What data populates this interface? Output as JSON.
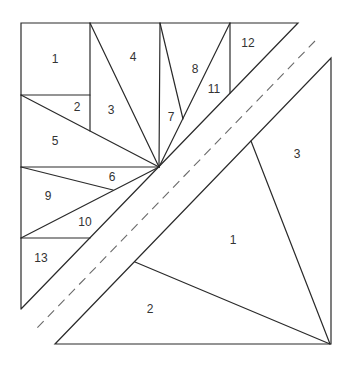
{
  "diagram": {
    "colors": {
      "line": "#2a2a2a",
      "dash": "#6a6a6a",
      "label": "#333333",
      "background": "#ffffff"
    },
    "upper_section": {
      "labels": [
        {
          "id": "u1",
          "text": "1",
          "x": 55,
          "y": 60
        },
        {
          "id": "u2",
          "text": "2",
          "x": 77,
          "y": 108
        },
        {
          "id": "u3",
          "text": "3",
          "x": 111,
          "y": 111
        },
        {
          "id": "u4",
          "text": "4",
          "x": 133,
          "y": 58
        },
        {
          "id": "u5",
          "text": "5",
          "x": 55,
          "y": 142
        },
        {
          "id": "u6",
          "text": "6",
          "x": 112,
          "y": 178
        },
        {
          "id": "u7",
          "text": "7",
          "x": 171,
          "y": 118
        },
        {
          "id": "u8",
          "text": "8",
          "x": 195,
          "y": 70
        },
        {
          "id": "u9",
          "text": "9",
          "x": 48,
          "y": 197
        },
        {
          "id": "u10",
          "text": "10",
          "x": 85,
          "y": 223
        },
        {
          "id": "u11",
          "text": "11",
          "x": 214,
          "y": 90
        },
        {
          "id": "u12",
          "text": "12",
          "x": 248,
          "y": 44
        },
        {
          "id": "u13",
          "text": "13",
          "x": 41,
          "y": 259
        }
      ]
    },
    "lower_section": {
      "labels": [
        {
          "id": "l1",
          "text": "1",
          "x": 233,
          "y": 241
        },
        {
          "id": "l2",
          "text": "2",
          "x": 150,
          "y": 310
        },
        {
          "id": "l3",
          "text": "3",
          "x": 297,
          "y": 155
        }
      ]
    },
    "seam_line": "dashed"
  }
}
